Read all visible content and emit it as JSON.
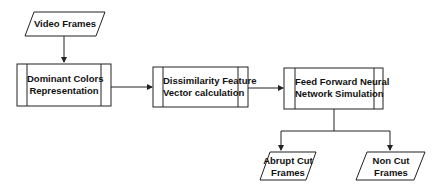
{
  "diagram": {
    "type": "flowchart",
    "nodes": {
      "video_frames": {
        "label": "Video Frames",
        "shape": "parallelogram"
      },
      "dominant_colors": {
        "line1": "Dominant Colors",
        "line2": "Representation",
        "shape": "predefined-process"
      },
      "dissimilarity": {
        "line1": "Dissimilarity Feature",
        "line2": "Vector calculation",
        "shape": "predefined-process"
      },
      "ffnn": {
        "line1": "Feed Forward Neural",
        "line2": "Network Simulation",
        "shape": "predefined-process"
      },
      "abrupt_cut": {
        "line1": "Abrupt Cut",
        "line2": "Frames",
        "shape": "parallelogram"
      },
      "non_cut": {
        "line1": "Non Cut",
        "line2": "Frames",
        "shape": "parallelogram"
      }
    },
    "edges": [
      {
        "from": "video_frames",
        "to": "dominant_colors"
      },
      {
        "from": "dominant_colors",
        "to": "dissimilarity"
      },
      {
        "from": "dissimilarity",
        "to": "ffnn"
      },
      {
        "from": "ffnn",
        "to": "abrupt_cut"
      },
      {
        "from": "ffnn",
        "to": "non_cut"
      }
    ],
    "colors": {
      "stroke": "#222222",
      "text": "#111111",
      "fill": "#ffffff"
    }
  }
}
